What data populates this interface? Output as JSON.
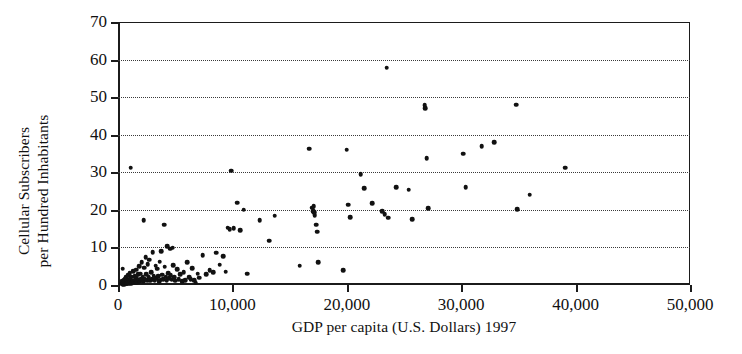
{
  "chart_data": {
    "type": "scatter",
    "title": "",
    "xlabel": "GDP per capita (U.S. Dollars) 1997",
    "ylabel_line1": "Cellular Subscribers",
    "ylabel_line2": "per Hundred Inhabitants",
    "ylabel": "Cellular Subscribers per Hundred Inhabitants",
    "xlim": [
      0,
      50000
    ],
    "ylim": [
      0,
      70
    ],
    "xticks": [
      0,
      10000,
      20000,
      30000,
      40000,
      50000
    ],
    "xtick_labels": [
      "0",
      "10,000",
      "20,000",
      "30,000",
      "40,000",
      "50,000"
    ],
    "yticks": [
      0,
      10,
      20,
      30,
      40,
      50,
      60,
      70
    ],
    "ytick_labels": [
      "0",
      "10",
      "20",
      "30",
      "40",
      "50",
      "60",
      "70"
    ],
    "grid": "horizontal-dotted",
    "legend": "none",
    "marker_color": "#111111",
    "axis_color": "#1b1b1b",
    "points": [
      [
        300,
        0.3
      ],
      [
        350,
        1.0
      ],
      [
        400,
        0.2
      ],
      [
        420,
        4.3
      ],
      [
        450,
        0.5
      ],
      [
        500,
        0.4
      ],
      [
        520,
        1.2
      ],
      [
        560,
        0.2
      ],
      [
        600,
        0.8
      ],
      [
        620,
        0.3
      ],
      [
        650,
        1.6
      ],
      [
        700,
        0.5
      ],
      [
        720,
        2.0
      ],
      [
        760,
        0.4
      ],
      [
        800,
        1.1
      ],
      [
        830,
        0.3
      ],
      [
        870,
        2.6
      ],
      [
        900,
        0.7
      ],
      [
        950,
        1.4
      ],
      [
        980,
        0.4
      ],
      [
        1020,
        3.2
      ],
      [
        1060,
        0.9
      ],
      [
        1100,
        31.2
      ],
      [
        1120,
        1.8
      ],
      [
        1160,
        0.5
      ],
      [
        1200,
        2.2
      ],
      [
        1250,
        0.6
      ],
      [
        1300,
        1.0
      ],
      [
        1350,
        3.6
      ],
      [
        1400,
        0.8
      ],
      [
        1450,
        2.4
      ],
      [
        1500,
        1.3
      ],
      [
        1560,
        0.6
      ],
      [
        1600,
        4.1
      ],
      [
        1650,
        1.9
      ],
      [
        1700,
        0.7
      ],
      [
        1760,
        2.8
      ],
      [
        1800,
        1.2
      ],
      [
        1850,
        5.0
      ],
      [
        1900,
        0.9
      ],
      [
        1950,
        3.0
      ],
      [
        2000,
        1.5
      ],
      [
        2080,
        6.0
      ],
      [
        2150,
        2.1
      ],
      [
        2200,
        1.0
      ],
      [
        2260,
        17.3
      ],
      [
        2300,
        4.6
      ],
      [
        2350,
        1.7
      ],
      [
        2420,
        7.4
      ],
      [
        2480,
        2.9
      ],
      [
        2550,
        1.3
      ],
      [
        2600,
        5.5
      ],
      [
        2680,
        2.0
      ],
      [
        2750,
        6.7
      ],
      [
        2820,
        1.1
      ],
      [
        2900,
        3.4
      ],
      [
        2980,
        1.6
      ],
      [
        3050,
        8.8
      ],
      [
        3120,
        2.5
      ],
      [
        3200,
        1.2
      ],
      [
        3280,
        5.1
      ],
      [
        3350,
        1.8
      ],
      [
        3420,
        4.3
      ],
      [
        3500,
        2.3
      ],
      [
        3580,
        1.0
      ],
      [
        3650,
        6.2
      ],
      [
        3720,
        1.4
      ],
      [
        3800,
        9.0
      ],
      [
        3880,
        2.7
      ],
      [
        3950,
        1.5
      ],
      [
        4020,
        16.1
      ],
      [
        4100,
        4.9
      ],
      [
        4180,
        2.2
      ],
      [
        4250,
        1.3
      ],
      [
        4320,
        10.4
      ],
      [
        4400,
        3.1
      ],
      [
        4480,
        1.8
      ],
      [
        4550,
        9.7
      ],
      [
        4620,
        2.6
      ],
      [
        4700,
        1.4
      ],
      [
        4780,
        9.9
      ],
      [
        4850,
        5.3
      ],
      [
        4920,
        2.0
      ],
      [
        5000,
        1.1
      ],
      [
        5150,
        4.2
      ],
      [
        5300,
        1.6
      ],
      [
        5450,
        2.8
      ],
      [
        5600,
        1.0
      ],
      [
        5750,
        3.4
      ],
      [
        5900,
        1.3
      ],
      [
        6050,
        6.0
      ],
      [
        6200,
        2.1
      ],
      [
        6350,
        1.5
      ],
      [
        6500,
        4.4
      ],
      [
        6650,
        1.2
      ],
      [
        6800,
        0.6
      ],
      [
        6950,
        3.0
      ],
      [
        7100,
        1.9
      ],
      [
        7400,
        8.0
      ],
      [
        7700,
        2.9
      ],
      [
        8000,
        4.0
      ],
      [
        8300,
        3.4
      ],
      [
        8600,
        8.6
      ],
      [
        8900,
        5.4
      ],
      [
        9200,
        7.6
      ],
      [
        9400,
        3.5
      ],
      [
        9600,
        15.3
      ],
      [
        9750,
        14.8
      ],
      [
        9900,
        30.4
      ],
      [
        10100,
        15.1
      ],
      [
        10400,
        21.9
      ],
      [
        10700,
        14.6
      ],
      [
        11000,
        20.0
      ],
      [
        11300,
        3.0
      ],
      [
        12400,
        17.3
      ],
      [
        13200,
        11.8
      ],
      [
        13700,
        18.4
      ],
      [
        15900,
        5.1
      ],
      [
        16700,
        36.3
      ],
      [
        17000,
        20.6
      ],
      [
        17050,
        19.7
      ],
      [
        17100,
        21.0
      ],
      [
        17150,
        19.3
      ],
      [
        17200,
        18.6
      ],
      [
        17300,
        16.0
      ],
      [
        17400,
        14.2
      ],
      [
        17500,
        6.0
      ],
      [
        19700,
        4.0
      ],
      [
        20000,
        36.0
      ],
      [
        20100,
        21.4
      ],
      [
        20300,
        18.0
      ],
      [
        21200,
        29.5
      ],
      [
        21500,
        25.8
      ],
      [
        22200,
        21.8
      ],
      [
        23100,
        19.6
      ],
      [
        23300,
        18.9
      ],
      [
        23500,
        57.8
      ],
      [
        23600,
        17.9
      ],
      [
        24300,
        26.1
      ],
      [
        25400,
        25.4
      ],
      [
        25700,
        17.5
      ],
      [
        26800,
        47.8
      ],
      [
        26850,
        47.0
      ],
      [
        27000,
        33.7
      ],
      [
        27100,
        20.4
      ],
      [
        30200,
        35.0
      ],
      [
        30400,
        26.0
      ],
      [
        31800,
        37.0
      ],
      [
        32900,
        38.0
      ],
      [
        34800,
        48.0
      ],
      [
        34900,
        20.2
      ],
      [
        36000,
        24.0
      ],
      [
        39100,
        31.2
      ]
    ]
  }
}
